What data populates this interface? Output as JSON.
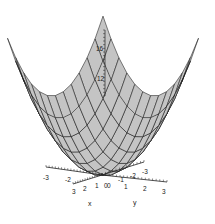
{
  "chart_data": {
    "type": "surface3d",
    "title": "",
    "function": "z = x^2 + y^2",
    "xlabel": "x",
    "ylabel": "y",
    "zlabel": "",
    "xlim": [
      -3,
      3
    ],
    "ylim": [
      -3,
      3
    ],
    "zlim": [
      0,
      18
    ],
    "x_ticks": [
      "-3",
      "-2",
      "-1",
      "0",
      "1",
      "2",
      "3"
    ],
    "y_ticks": [
      "-3",
      "-2",
      "-1",
      "0",
      "1",
      "2",
      "3"
    ],
    "z_ticks": [
      "12",
      "16"
    ],
    "visible_x_tick_labels": [
      "-3",
      "-2",
      "3",
      "2",
      "1",
      "0"
    ],
    "visible_y_tick_labels": [
      "0",
      "-1",
      "-2",
      "-3",
      "1",
      "2",
      "3"
    ],
    "grid_lines_per_side": 12,
    "surface_fill": "#c4c4c4",
    "mesh_color": "#1a1a1a",
    "corner_values": [
      {
        "x": -3,
        "y": -3,
        "z": 18
      },
      {
        "x": 3,
        "y": -3,
        "z": 18
      },
      {
        "x": -3,
        "y": 3,
        "z": 18
      },
      {
        "x": 3,
        "y": 3,
        "z": 18
      }
    ],
    "minimum": {
      "x": 0,
      "y": 0,
      "z": 0
    }
  },
  "labels": {
    "x_axis": "x",
    "y_axis": "y",
    "z16": "16",
    "z12": "12",
    "xt_m3": "-3",
    "xt_m2": "-2",
    "xt_3": "3",
    "xt_2": "2",
    "xt_1": "1",
    "origin": "0",
    "yt_0": "0",
    "yt_m1": "-1",
    "yt_m2": "-2",
    "yt_m3": "-3",
    "yt_1": "1",
    "yt_2": "2",
    "yt_3": "3"
  }
}
